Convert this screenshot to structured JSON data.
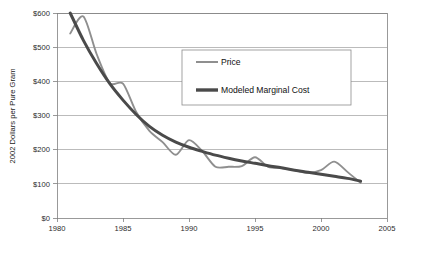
{
  "chart_data": {
    "type": "line",
    "title": "",
    "xlabel": "",
    "ylabel": "2002 Dollars per Pure Gram",
    "xlim": [
      1980,
      2005
    ],
    "ylim": [
      0,
      600
    ],
    "xticks": [
      "1980",
      "1985",
      "1990",
      "1995",
      "2000",
      "2005"
    ],
    "xtick_values": [
      1980,
      1985,
      1990,
      1995,
      2000,
      2005
    ],
    "yticks": [
      "$0",
      "$100",
      "$200",
      "$300",
      "$400",
      "$500",
      "$600"
    ],
    "ytick_values": [
      0,
      100,
      200,
      300,
      400,
      500,
      600
    ],
    "grid": true,
    "grid_axis": "y",
    "legend_position": "upper-center",
    "x": [
      1981,
      1982,
      1983,
      1984,
      1985,
      1986,
      1987,
      1988,
      1989,
      1990,
      1991,
      1992,
      1993,
      1994,
      1995,
      1996,
      1997,
      1998,
      1999,
      2000,
      2001,
      2002,
      2003
    ],
    "series": [
      {
        "name": "Price",
        "color": "#8f8f8f",
        "width": 1.9,
        "values": [
          540,
          590,
          480,
          395,
          393,
          310,
          255,
          222,
          185,
          228,
          196,
          150,
          150,
          152,
          178,
          150,
          146,
          140,
          132,
          140,
          165,
          135,
          103
        ]
      },
      {
        "name": "Modeled Marginal Cost",
        "color": "#4a4a4a",
        "width": 3.0,
        "values": [
          600,
          520,
          452,
          393,
          345,
          303,
          268,
          242,
          222,
          207,
          195,
          184,
          175,
          167,
          160,
          153,
          147,
          140,
          134,
          128,
          122,
          116,
          108
        ]
      }
    ],
    "legend": [
      {
        "label": "Price",
        "color": "#8f8f8f",
        "width": 2.0
      },
      {
        "label": "Modeled Marginal Cost",
        "color": "#4a4a4a",
        "width": 3.4
      }
    ]
  }
}
